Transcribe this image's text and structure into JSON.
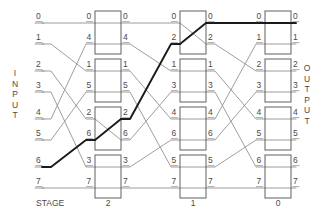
{
  "figure": {
    "type": "omega-network-diagram",
    "input_label": "INPUT",
    "output_label": "OUTPUT",
    "stage_row_label": "STAGE",
    "line_color": "#8c8c8c",
    "box_color": "#6e6e6e",
    "highlight_color": "#1a1a1a",
    "text_color": "#4a4a4a",
    "background": "#ffffff"
  },
  "stages": [
    {
      "name": "2",
      "label": "2",
      "x": 95
    },
    {
      "name": "1",
      "label": "1",
      "x": 180
    },
    {
      "name": "0",
      "label": "0",
      "x": 265
    }
  ],
  "input_ports": [
    "0",
    "1",
    "2",
    "3",
    "4",
    "5",
    "6",
    "7"
  ],
  "output_ports": [
    "0",
    "1",
    "2",
    "3",
    "4",
    "5",
    "6",
    "7"
  ],
  "column_labels": {
    "stage2_in": [
      "0",
      "1",
      "2",
      "3",
      "4",
      "5",
      "6",
      "7"
    ],
    "stage2_left": [
      "0",
      "4",
      "1",
      "5",
      "2",
      "6",
      "3",
      "7"
    ],
    "stage2_right": [
      "0",
      "4",
      "1",
      "5",
      "2",
      "6",
      "3",
      "7"
    ],
    "stage1_left": [
      "0",
      "2",
      "1",
      "3",
      "4",
      "6",
      "5",
      "7"
    ],
    "stage1_right": [
      "0",
      "2",
      "1",
      "3",
      "4",
      "6",
      "5",
      "7"
    ],
    "stage0_left": [
      "0",
      "1",
      "2",
      "3",
      "4",
      "5",
      "6",
      "7"
    ],
    "stage0_right": [
      "0",
      "1",
      "2",
      "3",
      "4",
      "5",
      "6",
      "7"
    ]
  },
  "switches": [
    {
      "stage": "2",
      "index": 0,
      "rows": [
        0,
        1
      ],
      "state": "through"
    },
    {
      "stage": "2",
      "index": 1,
      "rows": [
        2,
        3
      ],
      "state": "through"
    },
    {
      "stage": "2",
      "index": 2,
      "rows": [
        4,
        5
      ],
      "state": "cross"
    },
    {
      "stage": "2",
      "index": 3,
      "rows": [
        6,
        7
      ],
      "state": "through"
    },
    {
      "stage": "1",
      "index": 0,
      "rows": [
        0,
        1
      ],
      "state": "cross"
    },
    {
      "stage": "1",
      "index": 1,
      "rows": [
        2,
        3
      ],
      "state": "through"
    },
    {
      "stage": "1",
      "index": 2,
      "rows": [
        4,
        5
      ],
      "state": "through"
    },
    {
      "stage": "1",
      "index": 3,
      "rows": [
        6,
        7
      ],
      "state": "through"
    },
    {
      "stage": "0",
      "index": 0,
      "rows": [
        0,
        1
      ],
      "state": "through"
    },
    {
      "stage": "0",
      "index": 1,
      "rows": [
        2,
        3
      ],
      "state": "through"
    },
    {
      "stage": "0",
      "index": 2,
      "rows": [
        4,
        5
      ],
      "state": "through"
    },
    {
      "stage": "0",
      "index": 3,
      "rows": [
        6,
        7
      ],
      "state": "through"
    }
  ],
  "perm_in_to_stage2": [
    0,
    2,
    4,
    6,
    1,
    3,
    5,
    7
  ],
  "perm_stage2_to_1": [
    0,
    2,
    4,
    6,
    1,
    3,
    5,
    7
  ],
  "perm_stage1_to_0": [
    0,
    2,
    4,
    6,
    1,
    3,
    5,
    7
  ],
  "highlighted_path": {
    "from_input": "6",
    "to_output": "0",
    "description": "input 6 routed to output 0"
  },
  "stage_labels": [
    "2",
    "1",
    "0"
  ]
}
